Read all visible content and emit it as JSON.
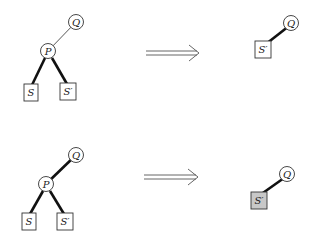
{
  "diagram": {
    "type": "tree-transformation",
    "rows": [
      {
        "id": "row1",
        "before": {
          "nodes": [
            {
              "id": "Q",
              "label": "Q",
              "shape": "circle"
            },
            {
              "id": "P",
              "label": "P",
              "shape": "circle"
            },
            {
              "id": "S",
              "label": "S",
              "shape": "square"
            },
            {
              "id": "S2",
              "label": "S′",
              "shape": "square"
            }
          ],
          "edges": [
            {
              "from": "Q",
              "to": "P",
              "weight": "thin"
            },
            {
              "from": "P",
              "to": "S",
              "weight": "thick"
            },
            {
              "from": "P",
              "to": "S2",
              "weight": "thick"
            }
          ]
        },
        "arrow": "⟹",
        "after": {
          "nodes": [
            {
              "id": "Q",
              "label": "Q",
              "shape": "circle"
            },
            {
              "id": "S2",
              "label": "S′",
              "shape": "square",
              "shaded": false
            }
          ],
          "edges": [
            {
              "from": "Q",
              "to": "S2",
              "weight": "thick"
            }
          ]
        }
      },
      {
        "id": "row2",
        "before": {
          "nodes": [
            {
              "id": "Q",
              "label": "Q",
              "shape": "circle"
            },
            {
              "id": "P",
              "label": "P",
              "shape": "circle"
            },
            {
              "id": "S",
              "label": "S",
              "shape": "square"
            },
            {
              "id": "S2",
              "label": "S′",
              "shape": "square"
            }
          ],
          "edges": [
            {
              "from": "Q",
              "to": "P",
              "weight": "thick"
            },
            {
              "from": "P",
              "to": "S",
              "weight": "thick"
            },
            {
              "from": "P",
              "to": "S2",
              "weight": "thick"
            }
          ]
        },
        "arrow": "⟹",
        "after": {
          "nodes": [
            {
              "id": "Q",
              "label": "Q",
              "shape": "circle"
            },
            {
              "id": "S2",
              "label": "S′",
              "shape": "square",
              "shaded": true
            }
          ],
          "edges": [
            {
              "from": "Q",
              "to": "S2",
              "weight": "thick"
            }
          ]
        }
      }
    ],
    "labels": {
      "q": "Q",
      "p": "P",
      "s": "S",
      "s_prime": "S′"
    },
    "colors": {
      "stroke": "#333333",
      "shaded_fill": "#c8c8c8",
      "background": "#ffffff"
    }
  }
}
